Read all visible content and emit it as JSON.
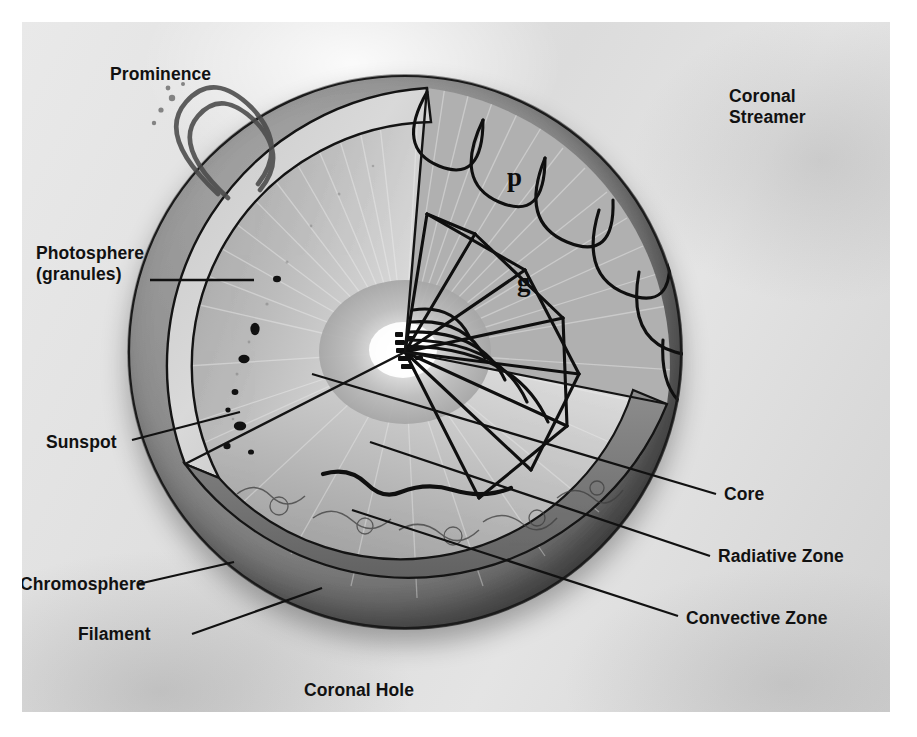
{
  "figure": {
    "style": "grayscale halftone photographic plate"
  },
  "labels": {
    "prominence": "Prominence",
    "coronal_streamer": "Coronal\nStreamer",
    "photosphere": "Photosphere\n(granules)",
    "sunspot": "Sunspot",
    "chromosphere": "Chromosphere",
    "filament": "Filament",
    "coronal_hole": "Coronal Hole",
    "core": "Core",
    "radiative_zone": "Radiative Zone",
    "convective_zone": "Convective Zone"
  },
  "mode_labels": {
    "p_mode": "p",
    "g_mode": "g"
  },
  "colors": {
    "plate_background": "#e2e2e2",
    "sun_surface": "#8e8e8e",
    "interior_light": "#c9c9c9",
    "core_glow": "#ffffff",
    "line": "#111111",
    "text": "#111111"
  }
}
